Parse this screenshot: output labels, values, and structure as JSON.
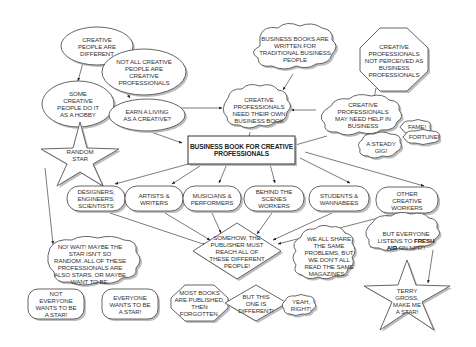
{
  "diagram": {
    "title": "Business Book for Creative Professionals",
    "nodes": {
      "creative_different": {
        "text": "CREATIVE\nPEOPLE ARE\nDIFFERENT",
        "shape": "ellipse"
      },
      "not_all_creative": {
        "text": "NOT ALL CREATIVE\nPEOPLE ARE\nCREATIVE\nPROFESSIONALS",
        "shape": "ellipse"
      },
      "hobby": {
        "text": "SOME\nCREATIVE\nPEOPLE DO IT\nAS A HOBBY",
        "shape": "ellipse"
      },
      "earn_living": {
        "text": "EARN A LIVING\nAS A CREATIVE?",
        "shape": "ellipse"
      },
      "books_written": {
        "text": "BUSINESS BOOKS ARE\nWRITTEN FOR\nTRADITIONAL BUSINESS\nPEOPLE",
        "shape": "cloud"
      },
      "not_perceived": {
        "text": "CREATIVE\nPROFESSIONALS\nNOT PERCEIVED AS\nBUSINESS\nPROFESSIONALS",
        "shape": "octagon"
      },
      "need_own": {
        "text": "CREATIVE\nPROFESSIONALS\nNEED THEIR OWN\nBUSINESS BOOK",
        "shape": "cloud"
      },
      "need_help": {
        "text": "CREATIVE\nPROFESSIONALS\nMAY NEED HELP IN\nBUSINESS",
        "shape": "cloud"
      },
      "fame": {
        "text": "FAME!",
        "shape": "cloud"
      },
      "fortune": {
        "text": "FORTUNE!",
        "shape": "cloud"
      },
      "steady_gig": {
        "text": "A STEADY\nGIG!",
        "shape": "cloud"
      },
      "random_star": {
        "text": "RANDOM\nSTAR",
        "shape": "star"
      },
      "main_book": {
        "text": "BUSINESS BOOK FOR CREATIVE\nPROFESSIONALS",
        "shape": "rectangle"
      },
      "designers": {
        "text": "DESIGNERS;\nENGINEERS;\nSCIENTISTS",
        "shape": "pill"
      },
      "artists": {
        "text": "ARTISTS &\nWRITERS",
        "shape": "pill"
      },
      "musicians": {
        "text": "MUSICIANS &\nPERFORMERS",
        "shape": "pill"
      },
      "behind_scenes": {
        "text": "BEHIND THE\nSCENES\nWORKERS",
        "shape": "pill"
      },
      "students": {
        "text": "STUDENTS &\nWANNABEES",
        "shape": "pill"
      },
      "other_creative": {
        "text": "OTHER\nCREATIVE\nWORKERS",
        "shape": "pill"
      },
      "publisher": {
        "text": "SOMEHOW, THE\nPUBLISHER MUST\nREACH ALL OF\nTHESE DIFFERENT\nPEOPLE!",
        "shape": "diamond"
      },
      "fresh_air_pre": {
        "text": "BUT EVERYONE\nLISTENS TO ",
        "shape": "cloud"
      },
      "fresh_air_bold": {
        "text": "FRESH\nAIR"
      },
      "fresh_air_post": {
        "text": " ON NPR!!"
      },
      "share_problems": {
        "text": "WE ALL SHARE\nTHE SAME\nPROBLEMS, BUT\nWE DON'T ALL\nREAD THE SAME\nMAGAZINES...",
        "shape": "cloud"
      },
      "no_wait": {
        "text": "NO! WAIT! MAYBE THE\nSTAR ISN'T SO\nRANDOM. ALL OF THESE\nPROFESSIONALS ARE\nALSO STARS, OR MAYBE\nWANT TO BE.",
        "shape": "cloud"
      },
      "not_everyone": {
        "text": "NOT\nEVERYONE\nWANTS TO BE\nA STAR!",
        "shape": "pill"
      },
      "everyone": {
        "text": "EVERYONE\nWANTS TO BE\nA STAR!",
        "shape": "pill"
      },
      "most_books": {
        "text": "MOST BOOKS\nARE PUBLISHED,\nTHEN\nFORGOTTEN.",
        "shape": "octagon"
      },
      "but_this": {
        "text": "BUT THIS\nONE IS\nDIFFERENT!",
        "shape": "diamond"
      },
      "yeah_right": {
        "text": "YEAH,\nRIGHT!",
        "shape": "cloud"
      },
      "terry_gross": {
        "text": "TERRY\nGROSS,\nMAKE ME\nA STAR!",
        "shape": "star"
      }
    },
    "colors": {
      "stroke": "#555555",
      "fill": "#ffffff",
      "shadow": "#bdbdbd",
      "text": "#333333"
    }
  }
}
